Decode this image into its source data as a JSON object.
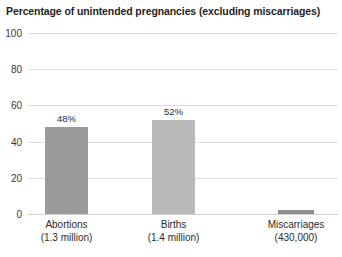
{
  "chart_data": {
    "type": "bar",
    "title": "Percentage of unintended pregnancies (excluding miscarriages)",
    "xlabel": "",
    "ylabel": "",
    "ylim": [
      0,
      100
    ],
    "yticks": [
      "0",
      "20",
      "40",
      "60",
      "80",
      "100"
    ],
    "grid": true,
    "legend": "none",
    "categories": [
      "Abortions",
      "Births",
      "Miscarriages"
    ],
    "category_sublabels": [
      "(1.3 million)",
      "(1.4 million)",
      "(430,000)"
    ],
    "values": [
      48,
      52,
      2
    ],
    "value_labels": [
      "48%",
      "52%",
      ""
    ],
    "bar_colors": [
      "#9b9b9b",
      "#b9b9b9",
      "#8f8f8f"
    ]
  },
  "colors": {
    "background": "#ffffff",
    "gridline": "#dedede",
    "baseline": "#cfcfcf",
    "text": "#2b2b2b"
  }
}
